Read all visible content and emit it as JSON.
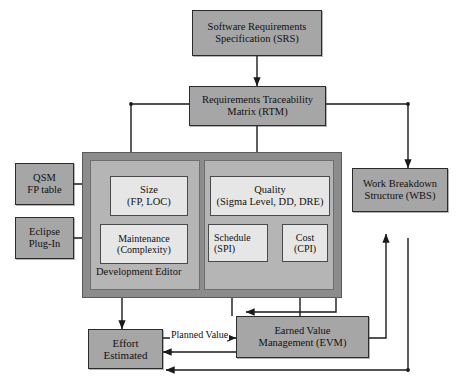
{
  "diagram": {
    "colors": {
      "node_fill": "#a6a6a6",
      "inner_fill": "#e6e6e6",
      "container_fill": "#8c8c8c",
      "panel_fill": "#b5b5b5",
      "line": "#1a1a1a",
      "background": "#ffffff"
    },
    "nodes": {
      "srs": {
        "line1": "Software Requirements",
        "line2": "Specification (SRS)"
      },
      "rtm": {
        "line1": "Requirements Traceability",
        "line2": "Matrix (RTM)"
      },
      "qsm": {
        "line1": "QSM",
        "line2": "FP table"
      },
      "eclipse": {
        "line1": "Eclipse",
        "line2": "Plug-In"
      },
      "size": {
        "line1": "Size",
        "line2": "(FP, LOC)"
      },
      "maintenance": {
        "line1": "Maintenance",
        "line2": "(Complexity)"
      },
      "quality": {
        "line1": "Quality",
        "line2": "(Sigma Level, DD, DRE)"
      },
      "schedule": {
        "line1": "Schedule",
        "line2": "(SPI)"
      },
      "cost": {
        "line1": "Cost",
        "line2": "(CPI)"
      },
      "wbs": {
        "line1": "Work Breakdown",
        "line2": "Structure (WBS)"
      },
      "evm": {
        "line1": "Earned Value",
        "line2": "Management (EVM)"
      },
      "effort": {
        "line1": "Effort",
        "line2": "Estimated"
      }
    },
    "container_label": "Development Editor",
    "edge_labels": {
      "planned_value": "Planned Value"
    }
  }
}
